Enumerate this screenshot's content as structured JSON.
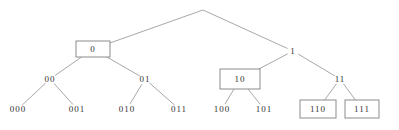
{
  "tree": {
    "root": {
      "id": "root",
      "label": ""
    },
    "nodes": [
      {
        "id": "n0",
        "label": "0",
        "parent": "root",
        "boxed": true
      },
      {
        "id": "n1",
        "label": "1",
        "parent": "root",
        "boxed": false
      },
      {
        "id": "n00",
        "label": "00",
        "parent": "n0",
        "boxed": false
      },
      {
        "id": "n01",
        "label": "01",
        "parent": "n0",
        "boxed": false
      },
      {
        "id": "n10",
        "label": "10",
        "parent": "n1",
        "boxed": true
      },
      {
        "id": "n11",
        "label": "11",
        "parent": "n1",
        "boxed": false
      },
      {
        "id": "n000",
        "label": "000",
        "parent": "n00",
        "boxed": false
      },
      {
        "id": "n001",
        "label": "001",
        "parent": "n00",
        "boxed": false
      },
      {
        "id": "n010",
        "label": "010",
        "parent": "n01",
        "boxed": false
      },
      {
        "id": "n011",
        "label": "011",
        "parent": "n01",
        "boxed": false
      },
      {
        "id": "n100",
        "label": "100",
        "parent": "n10",
        "boxed": false
      },
      {
        "id": "n101",
        "label": "101",
        "parent": "n10",
        "boxed": false
      },
      {
        "id": "n110",
        "label": "110",
        "parent": "n11",
        "boxed": true
      },
      {
        "id": "n111",
        "label": "111",
        "parent": "n11",
        "boxed": true
      }
    ]
  },
  "colors": {
    "edge": "#a8a8a8",
    "box": "#8c8c8c",
    "text": "#333333"
  }
}
